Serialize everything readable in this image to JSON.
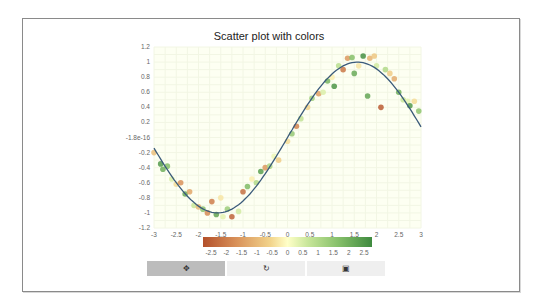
{
  "chart_data": {
    "type": "scatter",
    "title": "Scatter plot with colors",
    "xlabel": "",
    "ylabel": "",
    "xlim": [
      -3,
      3
    ],
    "ylim": [
      -1.2,
      1.2
    ],
    "x_ticks": [
      "-3",
      "-2.5",
      "-2",
      "-1.5",
      "-1",
      "-0.5",
      "0",
      "0.5",
      "1",
      "1.5",
      "2",
      "2.5",
      "3"
    ],
    "y_ticks": [
      "1.2",
      "1",
      "0.8",
      "0.6",
      "0.4",
      "0.2",
      "-1.8e-16",
      "-0.2",
      "-0.4",
      "-0.6",
      "-0.8",
      "-1",
      "-1.2"
    ],
    "line": {
      "name": "sin(x)",
      "color": "#3a5a7a",
      "function": "sin"
    },
    "colorbar": {
      "range": [
        -2.5,
        2.5
      ],
      "ticks": [
        "-2.5",
        "-2",
        "-1.5",
        "-1",
        "-0.5",
        "0",
        "0.5",
        "1",
        "1.5",
        "2",
        "2.5"
      ],
      "colormap": "RdYlGn-like (brown-orange → pale yellow → green)"
    },
    "points": [
      {
        "x": -3.0,
        "y": -0.2,
        "c": -0.8
      },
      {
        "x": -2.85,
        "y": -0.35,
        "c": 2.2
      },
      {
        "x": -2.8,
        "y": -0.42,
        "c": 1.8
      },
      {
        "x": -2.7,
        "y": -0.38,
        "c": 1.5
      },
      {
        "x": -2.6,
        "y": -0.55,
        "c": 0.4
      },
      {
        "x": -2.5,
        "y": -0.62,
        "c": -0.4
      },
      {
        "x": -2.4,
        "y": -0.6,
        "c": -1.5
      },
      {
        "x": -2.3,
        "y": -0.75,
        "c": 1.9
      },
      {
        "x": -2.2,
        "y": -0.72,
        "c": -1.2
      },
      {
        "x": -2.1,
        "y": -0.9,
        "c": 0.6
      },
      {
        "x": -2.0,
        "y": -0.92,
        "c": -0.9
      },
      {
        "x": -1.9,
        "y": -0.95,
        "c": 1.4
      },
      {
        "x": -1.8,
        "y": -1.0,
        "c": -1.6
      },
      {
        "x": -1.7,
        "y": -0.85,
        "c": -1.8
      },
      {
        "x": -1.6,
        "y": -1.02,
        "c": 2.0
      },
      {
        "x": -1.5,
        "y": -0.8,
        "c": -0.3
      },
      {
        "x": -1.45,
        "y": -1.05,
        "c": 0.3
      },
      {
        "x": -1.35,
        "y": -0.95,
        "c": 1.2
      },
      {
        "x": -1.25,
        "y": -1.05,
        "c": -2.2
      },
      {
        "x": -1.1,
        "y": -0.98,
        "c": 0.5
      },
      {
        "x": -1.0,
        "y": -0.72,
        "c": -2.0
      },
      {
        "x": -0.9,
        "y": -0.65,
        "c": 1.6
      },
      {
        "x": -0.8,
        "y": -0.55,
        "c": -0.2
      },
      {
        "x": -0.7,
        "y": -0.6,
        "c": 0.9
      },
      {
        "x": -0.6,
        "y": -0.45,
        "c": 2.1
      },
      {
        "x": -0.5,
        "y": -0.4,
        "c": -1.4
      },
      {
        "x": -0.4,
        "y": -0.38,
        "c": 1.0
      },
      {
        "x": -0.3,
        "y": -0.25,
        "c": 0.2
      },
      {
        "x": -0.2,
        "y": -0.3,
        "c": -0.6
      },
      {
        "x": 0.0,
        "y": -0.05,
        "c": -0.4
      },
      {
        "x": 0.1,
        "y": 0.05,
        "c": 1.3
      },
      {
        "x": 0.2,
        "y": 0.15,
        "c": -1.7
      },
      {
        "x": 0.3,
        "y": 0.25,
        "c": 0.7
      },
      {
        "x": 0.45,
        "y": 0.4,
        "c": -0.5
      },
      {
        "x": 0.55,
        "y": 0.52,
        "c": 1.1
      },
      {
        "x": 0.7,
        "y": 0.58,
        "c": -1.3
      },
      {
        "x": 0.8,
        "y": 0.6,
        "c": 0.4
      },
      {
        "x": 0.9,
        "y": 0.75,
        "c": 1.7
      },
      {
        "x": 1.0,
        "y": 0.8,
        "c": -0.2
      },
      {
        "x": 1.05,
        "y": 0.68,
        "c": 2.3
      },
      {
        "x": 1.15,
        "y": 0.95,
        "c": 0.8
      },
      {
        "x": 1.25,
        "y": 0.9,
        "c": -1.9
      },
      {
        "x": 1.35,
        "y": 1.05,
        "c": -1.4
      },
      {
        "x": 1.45,
        "y": 1.06,
        "c": 1.5
      },
      {
        "x": 1.5,
        "y": 0.85,
        "c": 1.9
      },
      {
        "x": 1.6,
        "y": 0.95,
        "c": -0.3
      },
      {
        "x": 1.7,
        "y": 1.08,
        "c": 2.4
      },
      {
        "x": 1.8,
        "y": 0.55,
        "c": 2.0
      },
      {
        "x": 1.85,
        "y": 1.05,
        "c": -1.0
      },
      {
        "x": 1.95,
        "y": 1.08,
        "c": -0.7
      },
      {
        "x": 2.0,
        "y": 0.95,
        "c": 0.5
      },
      {
        "x": 2.1,
        "y": 0.4,
        "c": -2.3
      },
      {
        "x": 2.2,
        "y": 0.9,
        "c": 0.9
      },
      {
        "x": 2.3,
        "y": 0.85,
        "c": -0.6
      },
      {
        "x": 2.4,
        "y": 0.78,
        "c": -1.1
      },
      {
        "x": 2.5,
        "y": 0.6,
        "c": 1.8
      },
      {
        "x": 2.6,
        "y": 0.5,
        "c": 0.6
      },
      {
        "x": 2.7,
        "y": 0.48,
        "c": 0.3
      },
      {
        "x": 2.75,
        "y": 0.42,
        "c": 2.2
      },
      {
        "x": 2.85,
        "y": 0.48,
        "c": -0.4
      },
      {
        "x": 2.95,
        "y": 0.35,
        "c": 1.4
      }
    ]
  },
  "toolbar": {
    "buttons": [
      {
        "name": "pan",
        "icon": "✥",
        "active": true
      },
      {
        "name": "reset",
        "icon": "↻",
        "active": false
      },
      {
        "name": "save",
        "icon": "▣",
        "active": false
      }
    ]
  }
}
